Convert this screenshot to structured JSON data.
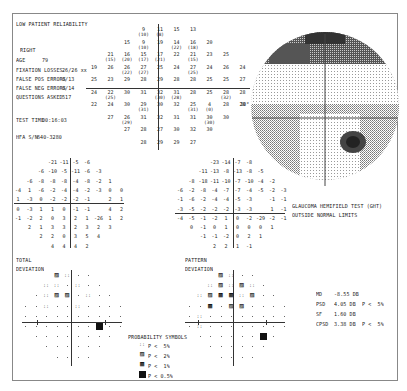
{
  "header": {
    "reliability_warning": "LOW PATIENT RELIABILITY",
    "eye": "RIGHT",
    "age_label": "AGE",
    "age_value": "79",
    "fixation_losses_label": "FIXATION LOSSES",
    "fixation_losses_value": "26/26 xx",
    "false_pos_label": "FALSE POS ERRORS",
    "false_pos_value": "0/13",
    "false_neg_label": "FALSE NEG ERRORS",
    "false_neg_value": "0/14",
    "questions_label": "QUESTIONS ASKED",
    "questions_value": "517",
    "test_time_label": "TEST TIME",
    "test_time_value": "00:16:03",
    "hfa_label": "HFA S/N",
    "hfa_value": "640-3280"
  },
  "threshold_grid": {
    "rows": [
      [
        "",
        "",
        "",
        "9(10)",
        "11(8)",
        "15",
        "13",
        "",
        "",
        ""
      ],
      [
        "",
        "",
        "15",
        "9(10)",
        "19",
        "14(22)",
        "16(18)",
        "20",
        "",
        ""
      ],
      [
        "",
        "21(15)",
        "16(20)",
        "15(17)",
        "17(21)",
        "22",
        "21(15)",
        "23",
        "25",
        ""
      ],
      [
        "19",
        "26",
        "26(22)",
        "27(27)",
        "25",
        "24",
        "27(25)",
        "24",
        "26",
        "24"
      ],
      [
        "25",
        "23",
        "29",
        "28",
        "29",
        "28",
        "28",
        "25",
        "25",
        "27"
      ],
      [
        "24",
        "22(25)",
        "30",
        "31",
        "32(30)",
        "31(28)",
        "28",
        "25",
        "28(32)",
        "28"
      ],
      [
        "22",
        "24",
        "30",
        "29(31)",
        "30",
        "32",
        "25(31)",
        "4(0)",
        "28",
        "28"
      ],
      [
        "",
        "27",
        "26(29)",
        "31",
        "32",
        "31",
        "31",
        "30(30)",
        "30",
        ""
      ],
      [
        "",
        "",
        "27",
        "28",
        "27",
        "30",
        "32",
        "30",
        "",
        ""
      ],
      [
        "",
        "",
        "",
        "28",
        "29",
        "29",
        "27",
        "",
        "",
        ""
      ]
    ],
    "blind_spot_label": "30°"
  },
  "total_deviation": {
    "rows": [
      [
        "",
        "",
        "",
        "-21",
        "-11",
        "-5",
        "-6",
        "",
        "",
        ""
      ],
      [
        "",
        "",
        "-6",
        "-10",
        "-5",
        "-11",
        "-6",
        "-3",
        "",
        ""
      ],
      [
        "",
        "-6",
        "-8",
        "-8",
        "-8",
        "-4",
        "-8",
        "-2",
        "1",
        ""
      ],
      [
        "-4",
        "1",
        "-6",
        "-2",
        "-4",
        "-4",
        "-2",
        "-3",
        "0",
        "0"
      ],
      [
        "1",
        "-3",
        "0",
        "-2",
        "-2",
        "-2",
        "-1",
        "",
        "2",
        "1"
      ],
      [
        "0",
        "-3",
        "1",
        "1",
        "0",
        "-1",
        "-1",
        "",
        "4",
        "2"
      ],
      [
        "-1",
        "-2",
        "2",
        "0",
        "3",
        "2",
        "1",
        "-26",
        "1",
        "2"
      ],
      [
        "",
        "2",
        "1",
        "3",
        "3",
        "2",
        "3",
        "2",
        "3",
        ""
      ],
      [
        "",
        "",
        "2",
        "2",
        "0",
        "3",
        "5",
        "4",
        "",
        ""
      ],
      [
        "",
        "",
        "",
        "4",
        "4",
        "4",
        "2",
        "",
        "",
        ""
      ]
    ],
    "label_line1": "TOTAL",
    "label_line2": "DEVIATION"
  },
  "pattern_deviation": {
    "rows": [
      [
        "",
        "",
        "",
        "-23",
        "-14",
        "-7",
        "-8",
        "",
        "",
        ""
      ],
      [
        "",
        "",
        "-11",
        "-13",
        "-8",
        "-13",
        "-8",
        "-5",
        "",
        ""
      ],
      [
        "",
        "-8",
        "-18",
        "-11",
        "-10",
        "-7",
        "-10",
        "-4",
        "-2",
        ""
      ],
      [
        "-6",
        "-2",
        "-8",
        "-4",
        "-7",
        "-7",
        "-4",
        "-5",
        "-2",
        "-3"
      ],
      [
        "-1",
        "-6",
        "-2",
        "-4",
        "-4",
        "-5",
        "-3",
        "",
        "-1",
        "-1"
      ],
      [
        "-3",
        "-5",
        "-2",
        "-2",
        "-2",
        "-3",
        "-3",
        "",
        "1",
        "-1"
      ],
      [
        "-4",
        "-5",
        "-1",
        "-2",
        "1",
        "0",
        "-2",
        "-29",
        "-2",
        "-1"
      ],
      [
        "",
        "0",
        "-1",
        "0",
        "1",
        "0",
        "0",
        "0",
        "1",
        ""
      ],
      [
        "",
        "",
        "-1",
        "-1",
        "-2",
        "0",
        "2",
        "1",
        "",
        ""
      ],
      [
        "",
        "",
        "",
        "2",
        "2",
        "1",
        "-1",
        "",
        "",
        ""
      ]
    ],
    "label_line1": "PATTERN",
    "label_line2": "DEVIATION"
  },
  "total_prob_map": {
    "rows": [
      [
        "",
        "",
        "",
        "p2",
        "p5",
        ".",
        ".",
        "",
        "",
        ""
      ],
      [
        "",
        "",
        "p5",
        "p5",
        ".",
        "p5",
        ".",
        ".",
        "",
        ""
      ],
      [
        "",
        ".",
        "p5",
        "p2",
        "p2",
        ".",
        "p5",
        ".",
        ".",
        ""
      ],
      [
        ".",
        ".",
        "p5",
        ".",
        ".",
        "p5",
        ".",
        ".",
        ".",
        "."
      ],
      [
        ".",
        ".",
        ".",
        ".",
        ".",
        ".",
        ".",
        ".",
        ".",
        "."
      ],
      [
        ".",
        ".",
        ".",
        ".",
        ".",
        ".",
        ".",
        "p05",
        ".",
        "."
      ],
      [
        "",
        ".",
        ".",
        ".",
        ".",
        ".",
        ".",
        ".",
        ".",
        ""
      ],
      [
        "",
        "",
        ".",
        ".",
        ".",
        ".",
        ".",
        ".",
        "",
        ""
      ],
      [
        "",
        "",
        "",
        ".",
        ".",
        ".",
        ".",
        "",
        "",
        ""
      ]
    ]
  },
  "pattern_prob_map": {
    "rows": [
      [
        "",
        "",
        "",
        "p2",
        "p5",
        ".",
        ".",
        "",
        "",
        ""
      ],
      [
        "",
        "",
        "p5",
        "p2",
        "p5",
        "p2",
        "p5",
        ".",
        "",
        ""
      ],
      [
        "",
        "p5",
        "p2",
        "p1",
        "p1",
        "p5",
        "p2",
        ".",
        ".",
        ""
      ],
      [
        ".",
        ".",
        "p1",
        ".",
        "p2",
        "p2",
        ".",
        ".",
        ".",
        "."
      ],
      [
        ".",
        "p5",
        ".",
        ".",
        ".",
        ".",
        ".",
        ".",
        ".",
        "."
      ],
      [
        ".",
        "p5",
        ".",
        ".",
        ".",
        ".",
        ".",
        ".",
        ".",
        "."
      ],
      [
        "",
        ".",
        ".",
        ".",
        ".",
        ".",
        ".",
        "p05",
        ".",
        ""
      ],
      [
        "",
        "",
        ".",
        ".",
        ".",
        ".",
        ".",
        ".",
        "",
        ""
      ],
      [
        "",
        "",
        "",
        ".",
        ".",
        ".",
        ".",
        "",
        "",
        ""
      ]
    ]
  },
  "probability_symbols": {
    "title": "PROBABILITY SYMBOLS",
    "items": [
      {
        "symbol": "p5",
        "label": "P <  5%"
      },
      {
        "symbol": "p2",
        "label": "P <  2%"
      },
      {
        "symbol": "p1",
        "label": "P <  1%"
      },
      {
        "symbol": "p05",
        "label": "P < 0.5%"
      }
    ]
  },
  "ght": {
    "title": "GLAUCOMA HEMIFIELD TEST (GHT)",
    "result": "OUTSIDE NORMAL LIMITS"
  },
  "global_indices": [
    {
      "name": "MD",
      "value": "-8.55 DB",
      "p": ""
    },
    {
      "name": "PSD",
      "value": "4.05 DB",
      "p": "P <  5%"
    },
    {
      "name": "SF",
      "value": "1.60 DB",
      "p": ""
    },
    {
      "name": "CPSD",
      "value": "3.38 DB",
      "p": "P <  5%"
    }
  ],
  "colors": {
    "ink": "#222222",
    "border": "#888888",
    "grayscale_dark": "#333333",
    "grayscale_mid": "#888888",
    "grayscale_light": "#cccccc"
  }
}
